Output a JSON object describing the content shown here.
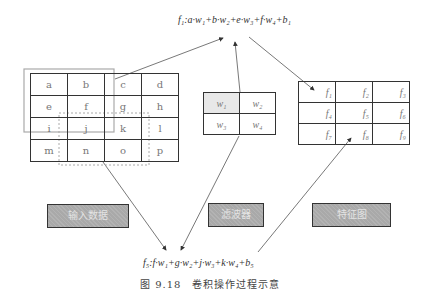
{
  "formula_top": {
    "text": "f₁:a·w₁+b·w₂+e·w₃+f·w₄+b₁"
  },
  "formula_bottom": {
    "text": "f₅:f·w₁+g·w₂+j·w₃+k·w₄+b₅"
  },
  "input_grid": {
    "rows": [
      [
        "a",
        "b",
        "c",
        "d"
      ],
      [
        "e",
        "f",
        "g",
        "h"
      ],
      [
        "i",
        "j",
        "k",
        "l"
      ],
      [
        "m",
        "n",
        "o",
        "p"
      ]
    ]
  },
  "filter_grid": {
    "rows": [
      [
        "w₁",
        "w₂"
      ],
      [
        "w₃",
        "w₄"
      ]
    ]
  },
  "feature_map": {
    "rows": [
      [
        "f₁",
        "f₂",
        "f₃"
      ],
      [
        "f₄",
        "f₅",
        "f₆"
      ],
      [
        "f₇",
        "f₈",
        "f₉"
      ]
    ]
  },
  "labels": {
    "input": "输入数据",
    "filter": "滤波器",
    "feature_map": "特征图"
  },
  "caption": "图 9.18　卷积操作过程示意",
  "colors": {
    "label_fill": "#a9a9a9",
    "grid_line": "#333333",
    "highlight_box": "#aaaaaa",
    "filter_w1_fill": "#e8e8e8"
  }
}
